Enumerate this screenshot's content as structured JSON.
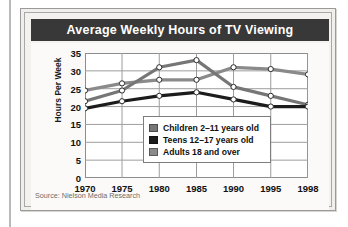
{
  "card": {
    "title": "Average Weekly Hours of TV Viewing",
    "source": "Source: Nielson Media Research"
  },
  "chart_data": {
    "type": "line",
    "title": "Average Weekly Hours of TV Viewing",
    "xlabel": "",
    "ylabel": "Hours Per Week",
    "categories": [
      "1970",
      "1975",
      "1980",
      "1985",
      "1990",
      "1995",
      "1998"
    ],
    "x_positions": [
      0,
      16.6,
      33.3,
      50,
      66.6,
      83.3,
      100
    ],
    "ylim": [
      0,
      35
    ],
    "yticks": [
      0,
      5,
      10,
      15,
      20,
      25,
      30,
      35
    ],
    "grid": true,
    "legend_position": "inside-center",
    "series": [
      {
        "name": "Children 2–11 years old",
        "color": "#767676",
        "values": [
          21.5,
          24.5,
          31,
          33,
          25.5,
          23,
          20.5
        ]
      },
      {
        "name": "Teens 12–17 years old",
        "color": "#1c1c1c",
        "values": [
          19.5,
          21.5,
          23,
          24,
          22,
          20,
          20
        ]
      },
      {
        "name": "Adults 18 and over",
        "color": "#8a8a8a",
        "values": [
          24.5,
          26.5,
          27.5,
          27.5,
          31,
          30.5,
          29
        ]
      }
    ]
  }
}
